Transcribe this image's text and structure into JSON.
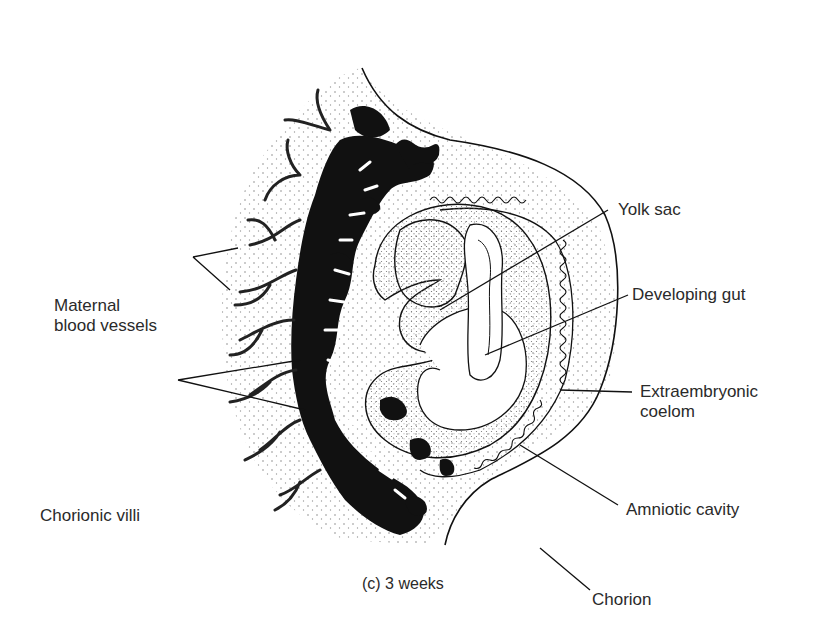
{
  "figure": {
    "caption": "(c) 3 weeks",
    "labels": {
      "maternal_blood_vessels_1": "Maternal",
      "maternal_blood_vessels_2": "blood vessels",
      "chorionic_villi": "Chorionic villi",
      "yolk_sac": "Yolk sac",
      "developing_gut": "Developing gut",
      "extraembryonic_coelom_1": "Extraembryonic",
      "extraembryonic_coelom_2": "coelom",
      "amniotic_cavity": "Amniotic cavity",
      "chorion": "Chorion"
    },
    "colors": {
      "ink": "#111111",
      "label_text": "#2a2a2a",
      "stipple": "#8a8a8a",
      "background": "#ffffff"
    }
  }
}
